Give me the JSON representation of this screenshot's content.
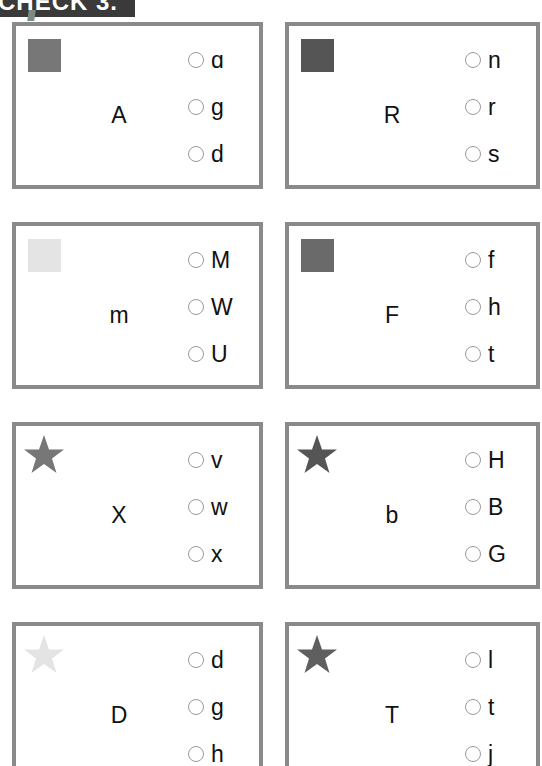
{
  "header": {
    "title": "CHECK 3."
  },
  "colors": {
    "border": "#8a8a8a",
    "shade_dark": "#555555",
    "shade_medium": "#777777",
    "shade_light": "#e4e4e4"
  },
  "cards": [
    {
      "icon": "square",
      "icon_shade": "#777777",
      "target": "A",
      "options": [
        "ɑ",
        "g",
        "d"
      ]
    },
    {
      "icon": "square",
      "icon_shade": "#555555",
      "target": "R",
      "options": [
        "n",
        "r",
        "s"
      ]
    },
    {
      "icon": "square",
      "icon_shade": "#e4e4e4",
      "target": "m",
      "options": [
        "M",
        "W",
        "U"
      ]
    },
    {
      "icon": "square",
      "icon_shade": "#6a6a6a",
      "target": "F",
      "options": [
        "f",
        "h",
        "t"
      ]
    },
    {
      "icon": "star",
      "icon_shade": "#777777",
      "target": "X",
      "options": [
        "v",
        "w",
        "x"
      ]
    },
    {
      "icon": "star",
      "icon_shade": "#555555",
      "target": "b",
      "options": [
        "H",
        "B",
        "G"
      ]
    },
    {
      "icon": "star",
      "icon_shade": "#e4e4e4",
      "target": "D",
      "options": [
        "d",
        "g",
        "h"
      ]
    },
    {
      "icon": "star",
      "icon_shade": "#5f5f5f",
      "target": "T",
      "options": [
        "l",
        "t",
        "j"
      ]
    }
  ]
}
